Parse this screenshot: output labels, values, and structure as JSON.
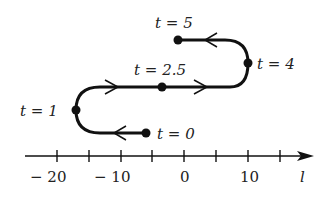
{
  "diagram": {
    "type": "motion-on-number-line",
    "axis": {
      "label": "l",
      "tick_labels": [
        {
          "value": "− 20",
          "x": 57
        },
        {
          "value": "− 10",
          "x": 121
        },
        {
          "value": "0",
          "x": 184
        },
        {
          "value": "10",
          "x": 248
        }
      ],
      "tick_positions": [
        57,
        89,
        121,
        152,
        184,
        216,
        248,
        280
      ]
    },
    "points": [
      {
        "label": "t = 0",
        "time": "0",
        "position": -5
      },
      {
        "label": "t = 1",
        "time": "1",
        "position": -17
      },
      {
        "label": "t = 2.5",
        "time": "2.5",
        "position": -5
      },
      {
        "label": "t = 4",
        "time": "4",
        "position": 10
      },
      {
        "label": "t = 5",
        "time": "5",
        "position": -1
      }
    ],
    "colors": {
      "stroke": "#111111",
      "background": "#ffffff"
    }
  }
}
